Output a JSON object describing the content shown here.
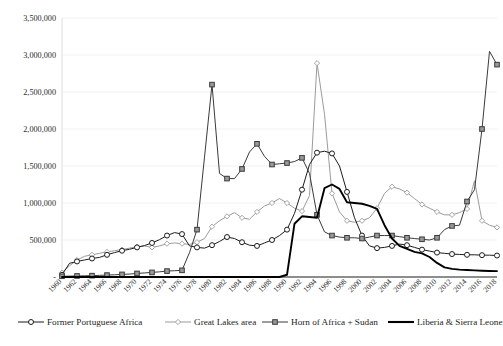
{
  "chart_data": {
    "type": "line",
    "title": "",
    "subtitle": "",
    "xlabel": "",
    "ylabel": "",
    "grid": true,
    "legend_position": "bottom",
    "ylim": [
      0,
      3500000
    ],
    "xlim": [
      1960,
      2018
    ],
    "ytick_labels": [
      "3,500,000",
      "3,000,000",
      "2,500,000",
      "2,000,000",
      "1,500,000",
      "1,000,000",
      "500,000",
      "-"
    ],
    "ytick_values": [
      3500000,
      3000000,
      2500000,
      2000000,
      1500000,
      1000000,
      500000,
      0
    ],
    "xtick_labels": [
      "1960",
      "1962",
      "1964",
      "1966",
      "1968",
      "1970",
      "1972",
      "1974",
      "1976",
      "1978",
      "1980",
      "1982",
      "1984",
      "1986",
      "1988",
      "1990",
      "1992",
      "1994",
      "1996",
      "1998",
      "2000",
      "2002",
      "2004",
      "2006",
      "2008",
      "2010",
      "2012",
      "2014",
      "2016",
      "2018"
    ],
    "x": [
      1960,
      1961,
      1962,
      1963,
      1964,
      1965,
      1966,
      1967,
      1968,
      1969,
      1970,
      1971,
      1972,
      1973,
      1974,
      1975,
      1976,
      1977,
      1978,
      1979,
      1980,
      1981,
      1982,
      1983,
      1984,
      1985,
      1986,
      1987,
      1988,
      1989,
      1990,
      1991,
      1992,
      1993,
      1994,
      1995,
      1996,
      1997,
      1998,
      1999,
      2000,
      2001,
      2002,
      2003,
      2004,
      2005,
      2006,
      2007,
      2008,
      2009,
      2010,
      2011,
      2012,
      2013,
      2014,
      2015,
      2016,
      2017,
      2018
    ],
    "series": [
      {
        "name": "Former Portuguese Africa",
        "marker": "circle",
        "color": "#1c1c1c",
        "values": [
          30000,
          185000,
          210000,
          230000,
          250000,
          265000,
          300000,
          330000,
          355000,
          375000,
          400000,
          425000,
          460000,
          505000,
          560000,
          600000,
          580000,
          420000,
          400000,
          390000,
          430000,
          480000,
          540000,
          520000,
          470000,
          430000,
          420000,
          460000,
          500000,
          560000,
          640000,
          860000,
          1180000,
          1520000,
          1680000,
          1700000,
          1670000,
          1500000,
          1150000,
          800000,
          560000,
          420000,
          390000,
          400000,
          420000,
          445000,
          430000,
          400000,
          370000,
          350000,
          330000,
          320000,
          310000,
          305000,
          300000,
          300000,
          295000,
          295000,
          290000
        ]
      },
      {
        "name": "Great Lakes area",
        "marker": "diamond",
        "color": "#9b9b9b",
        "values": [
          60000,
          150000,
          230000,
          280000,
          300000,
          320000,
          340000,
          355000,
          370000,
          390000,
          410000,
          420000,
          400000,
          420000,
          450000,
          460000,
          450000,
          440000,
          470000,
          520000,
          680000,
          760000,
          820000,
          870000,
          800000,
          780000,
          880000,
          960000,
          1000000,
          1060000,
          1000000,
          930000,
          890000,
          1100000,
          2890000,
          2200000,
          1130000,
          880000,
          760000,
          740000,
          760000,
          800000,
          930000,
          1130000,
          1220000,
          1190000,
          1140000,
          1060000,
          980000,
          930000,
          880000,
          840000,
          840000,
          870000,
          920000,
          1300000,
          760000,
          700000,
          670000
        ]
      },
      {
        "name": "Horn of Africa + Sudan",
        "marker": "square",
        "color": "#3a3a3a",
        "values": [
          10000,
          12000,
          14000,
          16000,
          18000,
          22000,
          26000,
          30000,
          35000,
          40000,
          48000,
          55000,
          62000,
          70000,
          80000,
          85000,
          90000,
          330000,
          640000,
          1620000,
          2600000,
          1400000,
          1330000,
          1330000,
          1460000,
          1690000,
          1800000,
          1630000,
          1520000,
          1530000,
          1540000,
          1560000,
          1610000,
          1400000,
          840000,
          610000,
          560000,
          540000,
          530000,
          530000,
          520000,
          540000,
          560000,
          560000,
          560000,
          545000,
          530000,
          520000,
          510000,
          500000,
          530000,
          640000,
          690000,
          700000,
          1020000,
          1180000,
          2000000,
          3050000,
          2870000
        ]
      },
      {
        "name": "Liberia & Sierra Leone",
        "marker": "none",
        "color": "#000000",
        "values": [
          0,
          0,
          0,
          0,
          0,
          0,
          0,
          0,
          0,
          0,
          0,
          0,
          0,
          0,
          0,
          0,
          0,
          0,
          0,
          0,
          0,
          0,
          0,
          0,
          0,
          0,
          0,
          0,
          0,
          0,
          30000,
          720000,
          820000,
          810000,
          800000,
          1200000,
          1250000,
          1190000,
          1010000,
          1000000,
          990000,
          960000,
          920000,
          700000,
          520000,
          420000,
          380000,
          340000,
          320000,
          270000,
          190000,
          130000,
          110000,
          100000,
          95000,
          90000,
          85000,
          82000,
          80000
        ]
      }
    ]
  },
  "legend": {
    "items": [
      {
        "label": "Former Portuguese Africa",
        "marker": "circle",
        "color": "#1c1c1c"
      },
      {
        "label": "Great Lakes area",
        "marker": "diamond",
        "color": "#9b9b9b"
      },
      {
        "label": "Horn of Africa + Sudan",
        "marker": "square",
        "color": "#3a3a3a"
      },
      {
        "label": "Liberia & Sierra Leone",
        "marker": "none",
        "color": "#000000"
      }
    ]
  }
}
